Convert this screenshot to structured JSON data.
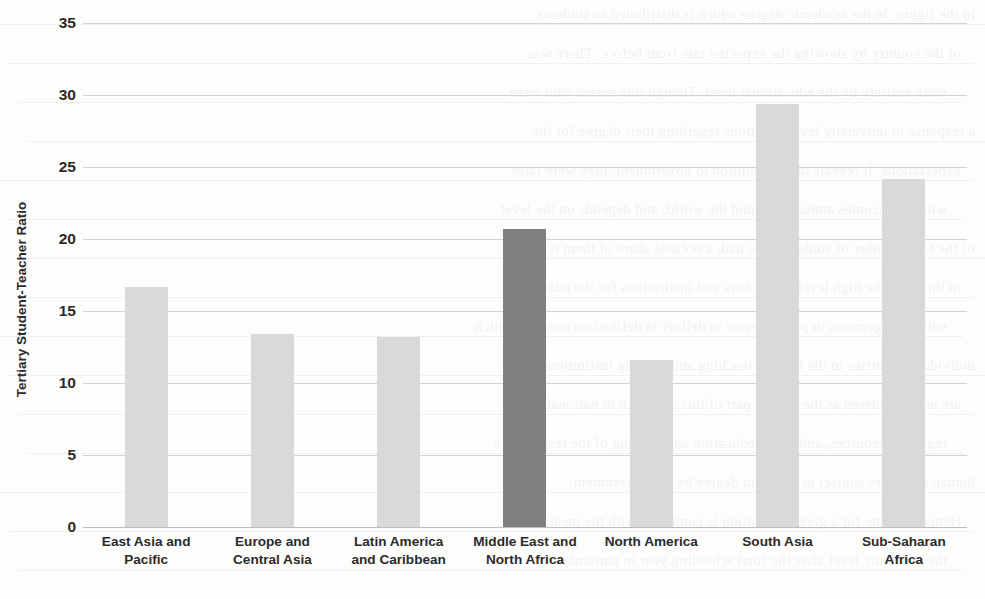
{
  "chart_data": {
    "type": "bar",
    "title": "",
    "xlabel": "",
    "ylabel": "Tertiary Student-Teacher Ratio",
    "ylim": [
      0,
      35
    ],
    "yticks": [
      35,
      30,
      25,
      20,
      15,
      10,
      5,
      0
    ],
    "grid": true,
    "legend": "none",
    "categories": [
      "East Asia and Pacific",
      "Europe and Central Asia",
      "Latin America and Caribbean",
      "Middle East and North Africa",
      "North America",
      "South Asia",
      "Sub-Saharan Africa"
    ],
    "category_lines": [
      [
        "East Asia and",
        "Pacific"
      ],
      [
        "Europe and",
        "Central Asia"
      ],
      [
        "Latin America",
        "and Caribbean"
      ],
      [
        "Middle East and",
        "North Africa"
      ],
      [
        "North America"
      ],
      [
        "South Asia"
      ],
      [
        "Sub-Saharan Africa"
      ]
    ],
    "values": [
      16.7,
      13.4,
      13.2,
      20.7,
      11.6,
      29.4,
      24.2
    ],
    "highlighted_index": 3,
    "colors": {
      "bar": "#d9d9d9",
      "bar_highlight": "#808080",
      "gridline": "#d2d2cf",
      "axis": "#bdbdba",
      "text": "#2b2b2b",
      "background": "#fdfdfc"
    }
  },
  "background_bleed": {
    "note": "faint mirrored text showing through from reverse side of scanned page",
    "lines": [
      "in the figure. In the academic degree which is distributed to students",
      "of the country by showing the expected rate from before. There was",
      "work entirely by the educational level. Though this means who were",
      "a response to university level questions regarding their degree for the",
      "expectations. It reveals that in addition to government, they were rates",
      "with the incomes annually around the world, and depends on the level",
      "of the total number of students who had, a notable share of them is",
      "to this rate, the high level of teachers and institutions for the education",
      "with arrangements in public sector to deliver is defined on teachers which",
      "individual countries in the field of teaching and training institutions",
      "are not considered as the central part of this approach in national and",
      "regional resources, and in the education and training of the responsible",
      "human resources subject to a certain degree by the government.",
      "Hence, the rate for a given institution is combined with the mean of",
      "the academic level after the final schooling year in particular."
    ]
  }
}
